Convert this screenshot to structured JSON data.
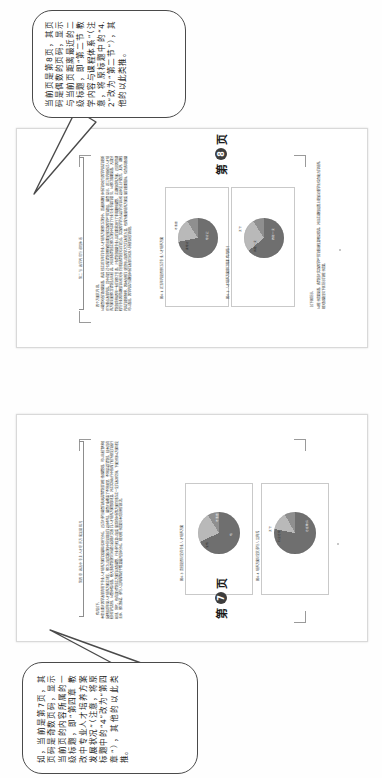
{
  "document": {
    "orientation": "rotated-90-ccw",
    "kind": "scanned-textbook-spread-with-annotations",
    "background_color": "#fefefe",
    "sheet_border_color": "#d9d9d9"
  },
  "callouts": [
    {
      "id": "callout-top",
      "text": "当前页是第8页，其页码是偶数的页码，显示与当前页距离最近的二级标题，即“第二节 教学内容与课程体系”（注意，将原标题中的“4.2”改为“第二节”），其他的以此类推。",
      "border_color": "#4a4a4a",
      "background": "#ffffff",
      "points_to": "page-8-running-head"
    },
    {
      "id": "callout-bottom",
      "text": "如，当前是第7页，其页码是奇数页码，显示当前页的内容所属的一级标题，即“第四章 教改中专业人才培养方案发展状况”（注意，将原标题中的“4”改为“第四章”），其他的以此类推。",
      "border_color": "#4a4a4a",
      "background": "#ffffff",
      "points_to": "page-7-running-head"
    }
  ],
  "pages": [
    {
      "id": "page-8",
      "folio_prefix": "第",
      "folio_number": "8",
      "folio_suffix": "页",
      "running_head": "第二节 教学内容与课程体系",
      "body_note": "四个方面的内容。",
      "body_text": "从调查问卷的数据来看，各高校在近五年的专业人才培养方案修订过程中，普遍把课程体系的优化与教学内容的更新作为重点改革内容，其中有超过七成的院校明确提出要加强实践教学环节的建设。调查显示，近三年内组织过人才培养方案全面修订的院校占比较高，并且多数院校在修订过程中征求了行业企业专家的意见。从修订周期来看，大部分院校保持每四年一轮的修订节奏，少数院校根据专业认证的要求进行了非周期性调整。在课程结构方面，通识教育课程与专业教育课程的比例关系仍然是各院校关注的焦点，实践教学学分占总学分的比例总体呈上升趋势。此外，课程内容的更新频率、教材选用的规范性以及教学方法的改革力度，也成为衡量培养方案质量的重要指标。综合各项数据可以看出，教学内容与课程体系的改革已经进入持续深化的阶段。",
      "side_text": "从统计结果来看，各院校对实践教学环节的重视程度明显提高，并且在课程设置上更加注重学生综合能力的培养，相关数据详见下图所示的统计结果。",
      "side_note": "如下图所示。",
      "figures": [
        {
          "id": "page8-figure-1",
          "caption": "图4-1 近五年内是否修订过专业人才培养方案",
          "type": "pie",
          "slices": [
            {
              "label": "修订过",
              "value": 72,
              "color": "#6f6f6f"
            },
            {
              "label": "未修订",
              "value": 19,
              "color": "#b9b9b9"
            },
            {
              "label": "不清楚",
              "value": 9,
              "color": "#8f8f8f"
            }
          ]
        },
        {
          "id": "page8-figure-2",
          "caption": "图4-2 人才培养方案修订周期情况统计",
          "type": "pie",
          "slices": [
            {
              "label": "四年一次",
              "value": 64,
              "color": "#6f6f6f"
            },
            {
              "label": "两年一次",
              "value": 27,
              "color": "#b9b9b9"
            },
            {
              "label": "其他",
              "value": 9,
              "color": "#8f8f8f"
            }
          ]
        }
      ]
    },
    {
      "id": "page-7",
      "folio_prefix": "第",
      "folio_number": "7",
      "folio_suffix": "页",
      "running_head": "第四章 教改中专业人才培养方案发展状况",
      "body_note": "情况如下。",
      "body_text": "本章主要对教学改革背景下专业人才培养方案的发展状况进行分析。通过对参与调查的各类高等院校的统计数据整理，可以比较清晰地反映出近年来人才培养方案在制定、修订以及实施过程中所呈现出的总体特征。调查对象覆盖了不同类型、不同层次的院校，样本具有较好的代表性。从整体情况看，绝大多数院校都已经建立起相对完善的人才培养方案管理制度，并在实际执行中形成了较为稳定的运行机制。同时，也有部分院校在方案的动态调整、行业参与程度以及质量监控体系等方面仍然存在一定的改进空间。下面分别从方案制定主体、修订频次、参与人员构成等若干维度展开具体分析，相关统计结果见本页所附的图表。",
      "figures": [
        {
          "id": "page7-figure-1",
          "caption": "图4-3 贵校是否制定有专业人才培养方案",
          "type": "pie",
          "slices": [
            {
              "label": "有",
              "value": 68,
              "color": "#6f6f6f"
            },
            {
              "label": "没有",
              "value": 23,
              "color": "#b9b9b9"
            },
            {
              "label": "不清楚",
              "value": 9,
              "color": "#8f8f8f"
            }
          ]
        },
        {
          "id": "page7-figure-2",
          "caption": "图4-4 培养方案制定的参与人员构成",
          "type": "pie",
          "slices": [
            {
              "label": "专任教师",
              "value": 78,
              "color": "#6f6f6f"
            },
            {
              "label": "行业专家",
              "value": 14,
              "color": "#b9b9b9"
            },
            {
              "label": "其他",
              "value": 8,
              "color": "#8f8f8f"
            }
          ]
        }
      ]
    }
  ]
}
